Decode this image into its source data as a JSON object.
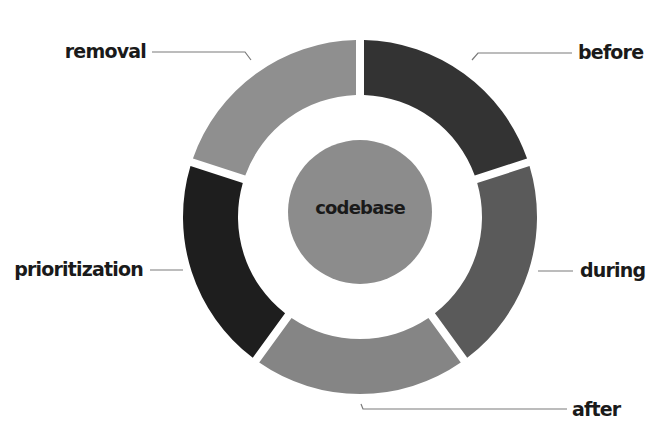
{
  "diagram": {
    "type": "donut",
    "center_label": "codebase",
    "center_color": "#8c8c8c",
    "background": "#ffffff",
    "geometry": {
      "cx": 360,
      "cy": 217,
      "outer_radius": 177,
      "inner_radius": 122,
      "center_radius": 72,
      "gap_px": 8
    },
    "segments": [
      {
        "label": "before",
        "color": "#333333",
        "start_deg": 0,
        "end_deg": 72
      },
      {
        "label": "during",
        "color": "#5a5a5a",
        "start_deg": 72,
        "end_deg": 144
      },
      {
        "label": "after",
        "color": "#858585",
        "start_deg": 144,
        "end_deg": 216
      },
      {
        "label": "prioritization",
        "color": "#1e1e1e",
        "start_deg": 216,
        "end_deg": 288
      },
      {
        "label": "removal",
        "color": "#8f8f8f",
        "start_deg": 288,
        "end_deg": 360
      }
    ],
    "labels": {
      "before": {
        "text": "before",
        "x": 578,
        "y": 59,
        "anchor": "start",
        "leader": "M 472 60 L 478 53 L 572 53"
      },
      "during": {
        "text": "during",
        "x": 580,
        "y": 277,
        "anchor": "start",
        "leader": "M 538 271 L 573 271"
      },
      "after": {
        "text": "after",
        "x": 572,
        "y": 416,
        "anchor": "start",
        "leader": "M 361 404 L 363 409 L 567 409"
      },
      "prioritization": {
        "text": "prioritization",
        "x": 143,
        "y": 276,
        "anchor": "end",
        "leader": "M 150 270 L 183 270"
      },
      "removal": {
        "text": "removal",
        "x": 146,
        "y": 58,
        "anchor": "end",
        "leader": "M 152 52 L 245 52 L 251 60"
      }
    }
  }
}
